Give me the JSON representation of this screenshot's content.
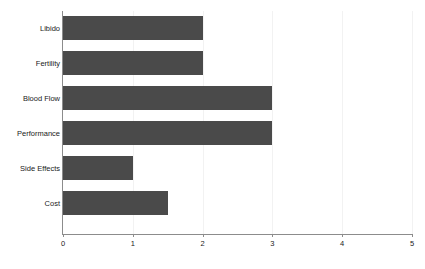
{
  "chart_data": {
    "type": "bar",
    "orientation": "horizontal",
    "title": "",
    "subtitle": "",
    "xlabel": "",
    "ylabel": "",
    "categories": [
      "Libido",
      "Fertility",
      "Blood Flow",
      "Performance",
      "Side Effects",
      "Cost"
    ],
    "values": [
      2,
      2,
      3,
      3,
      1,
      1.5
    ],
    "series": [
      {
        "name": "",
        "values": [
          2,
          2,
          3,
          3,
          1,
          1.5
        ]
      }
    ],
    "xlim": [
      0,
      5
    ],
    "xticks": [
      0,
      1,
      2,
      3,
      4,
      5
    ],
    "xtick_labels": [
      "0",
      "1",
      "2",
      "3",
      "4",
      "5"
    ],
    "grid": true,
    "grid_axis": "x",
    "legend": false,
    "legend_position": "none",
    "annotations": [],
    "colors": {
      "bar_fill": "#4a4a4a",
      "axis_line": "#8c8c8c",
      "gridline": "#f2f2f2",
      "background": "#ffffff",
      "text": "#1a1a1a"
    }
  }
}
